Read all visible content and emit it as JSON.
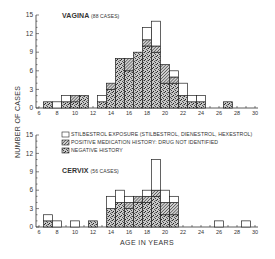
{
  "figure": {
    "ylabel": "NUMBER OF CASES",
    "xlabel": "AGE IN YEARS",
    "legend": [
      {
        "key": "stilbestrol",
        "label": "STILBESTROL EXPOSURE (STILBESTROL, DIENESTROL, HEXESTROL)",
        "pattern": "white"
      },
      {
        "key": "positive",
        "label": "POSITIVE MEDICATION HISTORY: DRUG NOT IDENTIFIED",
        "pattern": "hatched"
      },
      {
        "key": "negative",
        "label": "NEGATIVE HISTORY",
        "pattern": "stippled"
      }
    ],
    "panels": [
      {
        "title": "VAGINA",
        "subtitle": "(88 CASES)"
      },
      {
        "title": "CERVIX",
        "subtitle": "(56 CASES)"
      }
    ]
  },
  "chart_data": [
    {
      "type": "bar",
      "stacked": true,
      "title": "VAGINA (88 CASES)",
      "xlabel": "AGE IN YEARS",
      "ylabel": "NUMBER OF CASES",
      "xlim": [
        6,
        30
      ],
      "ylim": [
        0,
        15
      ],
      "xticks": [
        6,
        8,
        10,
        12,
        14,
        16,
        18,
        20,
        22,
        24,
        26,
        28,
        30
      ],
      "yticks": [
        0,
        3,
        6,
        9,
        12,
        15
      ],
      "categories": [
        7,
        8,
        9,
        10,
        11,
        13,
        14,
        15,
        16,
        17,
        18,
        19,
        20,
        21,
        22,
        23,
        24,
        27
      ],
      "series": [
        {
          "name": "NEGATIVE HISTORY",
          "values": [
            1,
            0,
            1,
            1,
            2,
            1,
            3,
            8,
            6,
            9,
            10,
            9,
            4,
            4,
            2,
            1,
            1,
            1
          ]
        },
        {
          "name": "POSITIVE MEDICATION HISTORY: DRUG NOT IDENTIFIED",
          "values": [
            0,
            0,
            0,
            1,
            0,
            0,
            1,
            0,
            2,
            0,
            1,
            1,
            3,
            1,
            0,
            0,
            0,
            0
          ]
        },
        {
          "name": "STILBESTROL EXPOSURE (STILBESTROL, DIENESTROL, HEXESTROL)",
          "values": [
            0,
            1,
            1,
            0,
            0,
            1,
            0,
            0,
            0,
            0,
            2,
            4,
            0,
            1,
            2,
            1,
            1,
            0
          ]
        }
      ],
      "legend_position": "between panels"
    },
    {
      "type": "bar",
      "stacked": true,
      "title": "CERVIX (56 CASES)",
      "xlabel": "AGE IN YEARS",
      "ylabel": "NUMBER OF CASES",
      "xlim": [
        6,
        30
      ],
      "ylim": [
        0,
        15
      ],
      "xticks": [
        6,
        8,
        10,
        12,
        14,
        16,
        18,
        20,
        22,
        24,
        26,
        28,
        30
      ],
      "yticks": [
        0,
        3,
        6,
        9,
        12,
        15
      ],
      "categories": [
        7,
        8,
        10,
        12,
        14,
        15,
        16,
        17,
        18,
        19,
        20,
        21,
        26,
        29
      ],
      "series": [
        {
          "name": "NEGATIVE HISTORY",
          "values": [
            1,
            0,
            0,
            1,
            3,
            4,
            3,
            4,
            4,
            5,
            2,
            2,
            0,
            0
          ]
        },
        {
          "name": "POSITIVE MEDICATION HISTORY: DRUG NOT IDENTIFIED",
          "values": [
            0,
            0,
            0,
            0,
            0,
            0,
            1,
            1,
            1,
            1,
            2,
            2,
            0,
            0
          ]
        },
        {
          "name": "STILBESTROL EXPOSURE (STILBESTROL, DIENESTROL, HEXESTROL)",
          "values": [
            1,
            1,
            1,
            0,
            2,
            2,
            1,
            0,
            1,
            5,
            2,
            1,
            1,
            1
          ]
        }
      ],
      "legend_position": "between panels"
    }
  ]
}
